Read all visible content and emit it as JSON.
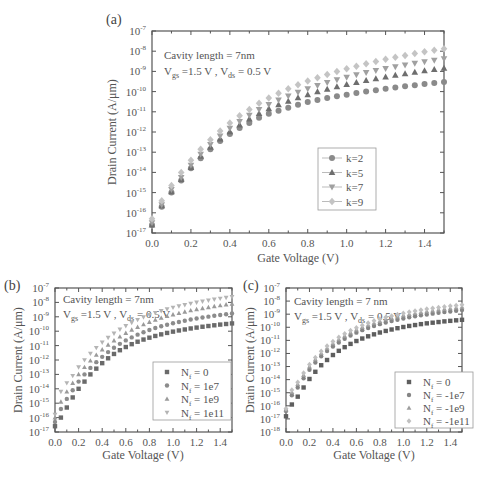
{
  "chart_data": [
    {
      "id": "a",
      "type": "scatter",
      "panel_label": "(a)",
      "title": "",
      "xlabel": "Gate Voltage (V)",
      "ylabel": "Drain Current (A/μm)",
      "yscale": "log",
      "xlim": [
        0.0,
        1.5
      ],
      "ylim_exp": [
        -17,
        -7
      ],
      "xticks": [
        "0.0",
        "0.2",
        "0.4",
        "0.6",
        "0.8",
        "1.0",
        "1.2",
        "1.4"
      ],
      "xtick_values": [
        0.0,
        0.2,
        0.4,
        0.6,
        0.8,
        1.0,
        1.2,
        1.4
      ],
      "ytick_exponents": [
        -7,
        -8,
        -9,
        -10,
        -11,
        -12,
        -13,
        -14,
        -15,
        -16,
        -17
      ],
      "annotations": [
        "Cavity length = 7nm",
        "V_gs =1.5 V , V_ds = 0.5 V"
      ],
      "legend_position": "center-right",
      "x": [
        0.0,
        0.05,
        0.1,
        0.15,
        0.2,
        0.25,
        0.3,
        0.35,
        0.4,
        0.45,
        0.5,
        0.55,
        0.6,
        0.65,
        0.7,
        0.75,
        0.8,
        0.85,
        0.9,
        0.95,
        1.0,
        1.05,
        1.1,
        1.15,
        1.2,
        1.25,
        1.3,
        1.35,
        1.4,
        1.45,
        1.5
      ],
      "series": [
        {
          "name": "k=2",
          "marker": "circle",
          "color": "#8a8a8a",
          "log10_values": [
            -16.6,
            -15.7,
            -15.0,
            -14.4,
            -13.8,
            -13.3,
            -12.85,
            -12.45,
            -12.1,
            -11.8,
            -11.55,
            -11.3,
            -11.1,
            -10.95,
            -10.8,
            -10.65,
            -10.52,
            -10.42,
            -10.32,
            -10.23,
            -10.15,
            -10.07,
            -10.0,
            -9.93,
            -9.86,
            -9.8,
            -9.74,
            -9.68,
            -9.62,
            -9.57,
            -9.52
          ]
        },
        {
          "name": "k=5",
          "marker": "triangle-up",
          "color": "#6e6e6e",
          "log10_values": [
            -16.6,
            -15.65,
            -14.95,
            -14.35,
            -13.75,
            -13.2,
            -12.75,
            -12.35,
            -11.98,
            -11.65,
            -11.35,
            -11.08,
            -10.85,
            -10.65,
            -10.47,
            -10.3,
            -10.15,
            -10.01,
            -9.88,
            -9.76,
            -9.65,
            -9.55,
            -9.45,
            -9.36,
            -9.27,
            -9.19,
            -9.11,
            -9.04,
            -8.97,
            -8.9,
            -8.84
          ]
        },
        {
          "name": "k=7",
          "marker": "triangle-down",
          "color": "#a0a0a0",
          "log10_values": [
            -16.5,
            -15.6,
            -14.85,
            -14.25,
            -13.65,
            -13.1,
            -12.62,
            -12.2,
            -11.82,
            -11.48,
            -11.17,
            -10.89,
            -10.64,
            -10.42,
            -10.22,
            -10.03,
            -9.86,
            -9.7,
            -9.55,
            -9.42,
            -9.29,
            -9.17,
            -9.06,
            -8.96,
            -8.86,
            -8.77,
            -8.68,
            -8.6,
            -8.52,
            -8.45,
            -8.38
          ]
        },
        {
          "name": "k=9",
          "marker": "diamond",
          "color": "#c4c4c4",
          "log10_values": [
            -16.3,
            -15.4,
            -14.65,
            -14.0,
            -13.4,
            -12.85,
            -12.38,
            -11.95,
            -11.56,
            -11.2,
            -10.88,
            -10.58,
            -10.32,
            -10.08,
            -9.86,
            -9.66,
            -9.48,
            -9.31,
            -9.15,
            -9.0,
            -8.87,
            -8.74,
            -8.62,
            -8.51,
            -8.4,
            -8.3,
            -8.21,
            -8.12,
            -8.03,
            -7.95,
            -7.88
          ]
        }
      ]
    },
    {
      "id": "b",
      "type": "scatter",
      "panel_label": "(b)",
      "title": "",
      "xlabel": "Gate Voltage (V)",
      "ylabel": "Drain Current (A/μm)",
      "yscale": "log",
      "xlim": [
        0.0,
        1.5
      ],
      "ylim_exp": [
        -17,
        -7
      ],
      "xticks": [
        "0.0",
        "0.2",
        "0.4",
        "0.6",
        "0.8",
        "1.0",
        "1.2",
        "1.4"
      ],
      "xtick_values": [
        0.0,
        0.2,
        0.4,
        0.6,
        0.8,
        1.0,
        1.2,
        1.4
      ],
      "ytick_exponents": [
        -7,
        -8,
        -9,
        -10,
        -11,
        -12,
        -13,
        -14,
        -15,
        -16,
        -17
      ],
      "annotations": [
        "Cavity length = 7nm",
        "V_gs =1.5 V , V_ds = 0.5 V"
      ],
      "legend_position": "center-right",
      "x": [
        0.0,
        0.05,
        0.1,
        0.15,
        0.2,
        0.25,
        0.3,
        0.35,
        0.4,
        0.45,
        0.5,
        0.55,
        0.6,
        0.65,
        0.7,
        0.75,
        0.8,
        0.85,
        0.9,
        0.95,
        1.0,
        1.05,
        1.1,
        1.15,
        1.2,
        1.25,
        1.3,
        1.35,
        1.4,
        1.45,
        1.5
      ],
      "series": [
        {
          "name": "N_f = 0",
          "marker": "square",
          "color": "#6a6a6a",
          "log10_values": [
            -16.6,
            -16.0,
            -15.3,
            -14.6,
            -14.0,
            -13.5,
            -13.0,
            -12.6,
            -12.22,
            -11.88,
            -11.58,
            -11.32,
            -11.1,
            -10.9,
            -10.73,
            -10.58,
            -10.45,
            -10.33,
            -10.22,
            -10.12,
            -10.03,
            -9.95,
            -9.88,
            -9.81,
            -9.75,
            -9.69,
            -9.64,
            -9.59,
            -9.54,
            -9.5,
            -9.46
          ]
        },
        {
          "name": "N_f = 1e7",
          "marker": "circle",
          "color": "#8c8c8c",
          "log10_values": [
            -16.3,
            -15.4,
            -14.7,
            -14.1,
            -13.5,
            -13.0,
            -12.55,
            -12.15,
            -11.78,
            -11.45,
            -11.15,
            -10.88,
            -10.64,
            -10.43,
            -10.24,
            -10.07,
            -9.92,
            -9.78,
            -9.66,
            -9.55,
            -9.45,
            -9.36,
            -9.27,
            -9.19,
            -9.12,
            -9.05,
            -8.99,
            -8.93,
            -8.87,
            -8.82,
            -8.77
          ]
        },
        {
          "name": "N_f = 1e9",
          "marker": "triangle-up",
          "color": "#9a9a9a",
          "log10_values": [
            -16.0,
            -14.9,
            -14.2,
            -13.6,
            -13.0,
            -12.5,
            -12.05,
            -11.65,
            -11.28,
            -10.95,
            -10.65,
            -10.38,
            -10.13,
            -9.91,
            -9.71,
            -9.53,
            -9.37,
            -9.22,
            -9.08,
            -8.96,
            -8.85,
            -8.75,
            -8.65,
            -8.56,
            -8.48,
            -8.41,
            -8.34,
            -8.27,
            -8.21,
            -8.15,
            -8.1
          ]
        },
        {
          "name": "N_f = 1e11",
          "marker": "triangle-down",
          "color": "#b4b4b4",
          "log10_values": [
            -15.8,
            -14.2,
            -13.6,
            -13.1,
            -12.5,
            -12.0,
            -11.55,
            -11.15,
            -10.78,
            -10.45,
            -10.15,
            -9.88,
            -9.63,
            -9.41,
            -9.21,
            -9.03,
            -8.87,
            -8.72,
            -8.59,
            -8.47,
            -8.36,
            -8.26,
            -8.17,
            -8.08,
            -8.0,
            -7.93,
            -7.86,
            -7.79,
            -7.73,
            -7.67,
            -7.62
          ]
        }
      ]
    },
    {
      "id": "c",
      "type": "scatter",
      "panel_label": "(c)",
      "title": "",
      "xlabel": "Gate Voltage (V)",
      "ylabel": "Drain Current (A/μm)",
      "yscale": "log",
      "xlim": [
        0.0,
        1.5
      ],
      "ylim_exp": [
        -18,
        -7
      ],
      "xticks": [
        "0.0",
        "0.2",
        "0.4",
        "0.6",
        "0.8",
        "1.0",
        "1.2",
        "1.4"
      ],
      "xtick_values": [
        0.0,
        0.2,
        0.4,
        0.6,
        0.8,
        1.0,
        1.2,
        1.4
      ],
      "ytick_exponents": [
        -7,
        -8,
        -9,
        -10,
        -11,
        -12,
        -13,
        -14,
        -15,
        -16,
        -17,
        -18
      ],
      "annotations": [
        "Cavity length = 7 nm",
        "V_gs =1.5 V , V_ds = 0.5 V"
      ],
      "legend_position": "center-right",
      "x": [
        0.0,
        0.05,
        0.1,
        0.15,
        0.2,
        0.25,
        0.3,
        0.35,
        0.4,
        0.45,
        0.5,
        0.55,
        0.6,
        0.65,
        0.7,
        0.75,
        0.8,
        0.85,
        0.9,
        0.95,
        1.0,
        1.05,
        1.1,
        1.15,
        1.2,
        1.25,
        1.3,
        1.35,
        1.4,
        1.45,
        1.5
      ],
      "series": [
        {
          "name": "N_f = 0",
          "marker": "square",
          "color": "#5e5e5e",
          "log10_values": [
            -16.8,
            -15.9,
            -15.3,
            -14.6,
            -13.95,
            -13.4,
            -12.9,
            -12.5,
            -12.12,
            -11.8,
            -11.52,
            -11.27,
            -11.05,
            -10.86,
            -10.69,
            -10.54,
            -10.4,
            -10.28,
            -10.17,
            -10.07,
            -9.98,
            -9.9,
            -9.83,
            -9.76,
            -9.7,
            -9.65,
            -9.6,
            -9.55,
            -9.51,
            -9.47,
            -9.43
          ]
        },
        {
          "name": "N_f = -1e7",
          "marker": "circle",
          "color": "#858585",
          "log10_values": [
            -16.4,
            -15.2,
            -14.6,
            -13.9,
            -13.25,
            -12.7,
            -12.22,
            -11.82,
            -11.47,
            -11.16,
            -10.88,
            -10.63,
            -10.41,
            -10.22,
            -10.05,
            -9.9,
            -9.76,
            -9.63,
            -9.52,
            -9.42,
            -9.33,
            -9.24,
            -9.16,
            -9.09,
            -9.02,
            -8.96,
            -8.9,
            -8.84,
            -8.79,
            -8.74,
            -8.69
          ]
        },
        {
          "name": "N_f = -1e9",
          "marker": "triangle-up",
          "color": "#9e9e9e",
          "log10_values": [
            -16.3,
            -14.95,
            -14.35,
            -13.65,
            -13.0,
            -12.45,
            -11.98,
            -11.58,
            -11.23,
            -10.92,
            -10.65,
            -10.4,
            -10.18,
            -9.99,
            -9.82,
            -9.67,
            -9.53,
            -9.4,
            -9.29,
            -9.18,
            -9.09,
            -9.0,
            -8.92,
            -8.85,
            -8.78,
            -8.72,
            -8.66,
            -8.6,
            -8.55,
            -8.5,
            -8.45
          ]
        },
        {
          "name": "N_f = -1e11",
          "marker": "diamond",
          "color": "#c0c0c0",
          "log10_values": [
            -16.2,
            -14.8,
            -14.2,
            -13.5,
            -12.85,
            -12.3,
            -11.83,
            -11.43,
            -11.08,
            -10.77,
            -10.5,
            -10.25,
            -10.03,
            -9.84,
            -9.67,
            -9.51,
            -9.37,
            -9.24,
            -9.13,
            -9.02,
            -8.93,
            -8.84,
            -8.76,
            -8.68,
            -8.61,
            -8.55,
            -8.49,
            -8.43,
            -8.38,
            -8.33,
            -8.28
          ]
        }
      ]
    }
  ]
}
